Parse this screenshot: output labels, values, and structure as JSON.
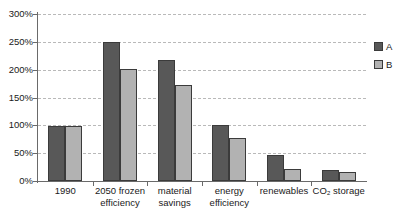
{
  "chart_data": {
    "type": "bar",
    "title": "",
    "subtitle": "",
    "xlabel": "",
    "ylabel": "",
    "ylim": [
      0,
      300
    ],
    "y_unit": "%",
    "y_ticks": [
      0,
      50,
      100,
      150,
      200,
      250,
      300
    ],
    "y_tick_labels": [
      "0%",
      "50%",
      "100%",
      "150%",
      "200%",
      "250%",
      "300%"
    ],
    "grid": "horizontal-dashed",
    "legend_position": "right",
    "categories": [
      "1990",
      "2050 frozen efficiency",
      "material savings",
      "energy efficiency",
      "renewables",
      "CO2 storage"
    ],
    "category_labels": [
      "1990",
      "2050 frozen\nefficiency",
      "material\nsavings",
      "energy\nefficiency",
      "renewables",
      "CO₂ storage"
    ],
    "series": [
      {
        "name": "A",
        "color": "#585858",
        "values": [
          98,
          250,
          218,
          101,
          47,
          19
        ]
      },
      {
        "name": "B",
        "color": "#b2b2b2",
        "values": [
          98,
          202,
          172,
          78,
          22,
          17
        ]
      }
    ],
    "annotations": []
  },
  "legend": {
    "items": [
      {
        "label": "A",
        "swatch": "series-a"
      },
      {
        "label": "B",
        "swatch": "series-b"
      }
    ]
  },
  "colors": {
    "series_a": "#585858",
    "series_b": "#b2b2b2",
    "axis": "#6a6a6a",
    "gridline": "#b9b9b9",
    "bar_outline": "#3b3b3b",
    "text": "#1a1a1a",
    "background": "#ffffff"
  }
}
